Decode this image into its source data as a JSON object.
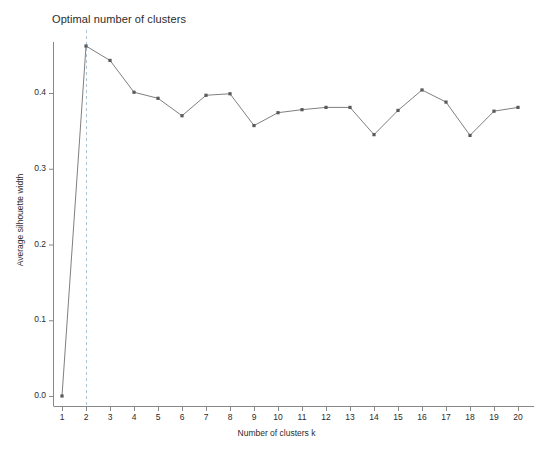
{
  "chart_data": {
    "type": "line",
    "title": "Optimal number of clusters",
    "xlabel": "Number of clusters k",
    "ylabel": "Average silhouette width",
    "x": [
      1,
      2,
      3,
      4,
      5,
      6,
      7,
      8,
      9,
      10,
      11,
      12,
      13,
      14,
      15,
      16,
      17,
      18,
      19,
      20
    ],
    "values": [
      0.0,
      0.462,
      0.443,
      0.401,
      0.393,
      0.37,
      0.397,
      0.399,
      0.357,
      0.374,
      0.378,
      0.381,
      0.381,
      0.345,
      0.377,
      0.404,
      0.388,
      0.344,
      0.376,
      0.381
    ],
    "xtick_labels": [
      "1",
      "2",
      "3",
      "4",
      "5",
      "6",
      "7",
      "8",
      "9",
      "10",
      "11",
      "12",
      "13",
      "14",
      "15",
      "16",
      "17",
      "18",
      "19",
      "20"
    ],
    "ytick_labels": [
      "0.0",
      "0.1",
      "0.2",
      "0.3",
      "0.4"
    ],
    "ytick_values": [
      0.0,
      0.1,
      0.2,
      0.3,
      0.4
    ],
    "xlim": [
      0.55,
      20.45
    ],
    "ylim": [
      0.0,
      0.475
    ],
    "grid": false,
    "legend": "none",
    "annotations": [
      {
        "name": "optimal-k-vline",
        "type": "vertical-dashed-line",
        "x": 2,
        "color": "#a8c4d4"
      }
    ],
    "series_color": "#7f7f7f",
    "marker_color": "#595959",
    "marker_shape": "square",
    "background_color": "#ffffff",
    "axis_color": "#888888"
  }
}
